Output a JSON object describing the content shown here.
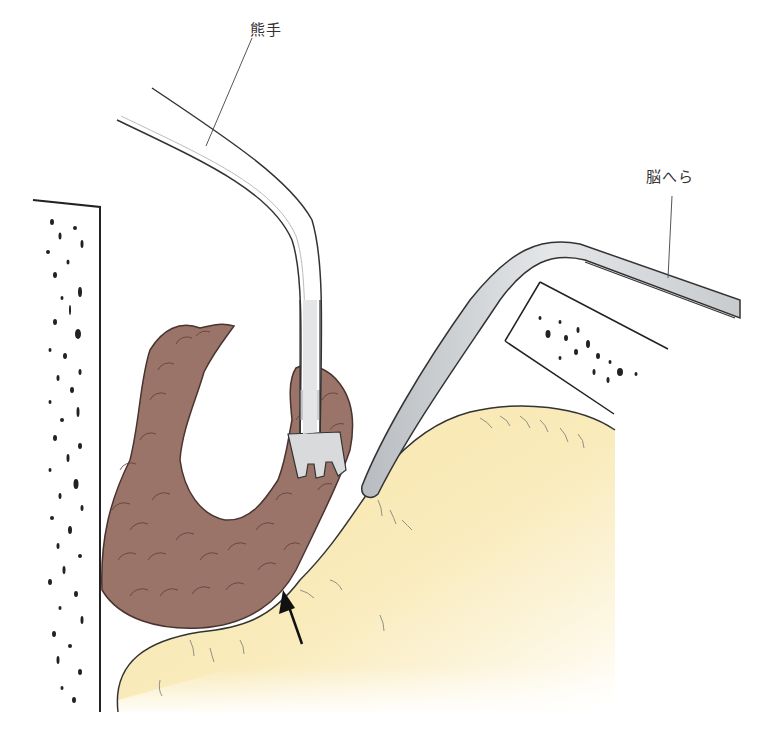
{
  "labels": {
    "rake": "熊手",
    "brain_spatula": "脳へら"
  },
  "colors": {
    "tissue_brown": "#9a7468",
    "tissue_outline": "#4a3430",
    "brain_yellow": "#f8e8b0",
    "instrument_gray": "#d4d6d8",
    "line": "#333333"
  },
  "arrow": {
    "direction": "up-left",
    "meaning": "indicates contact point between tissue mass and brain surface"
  }
}
